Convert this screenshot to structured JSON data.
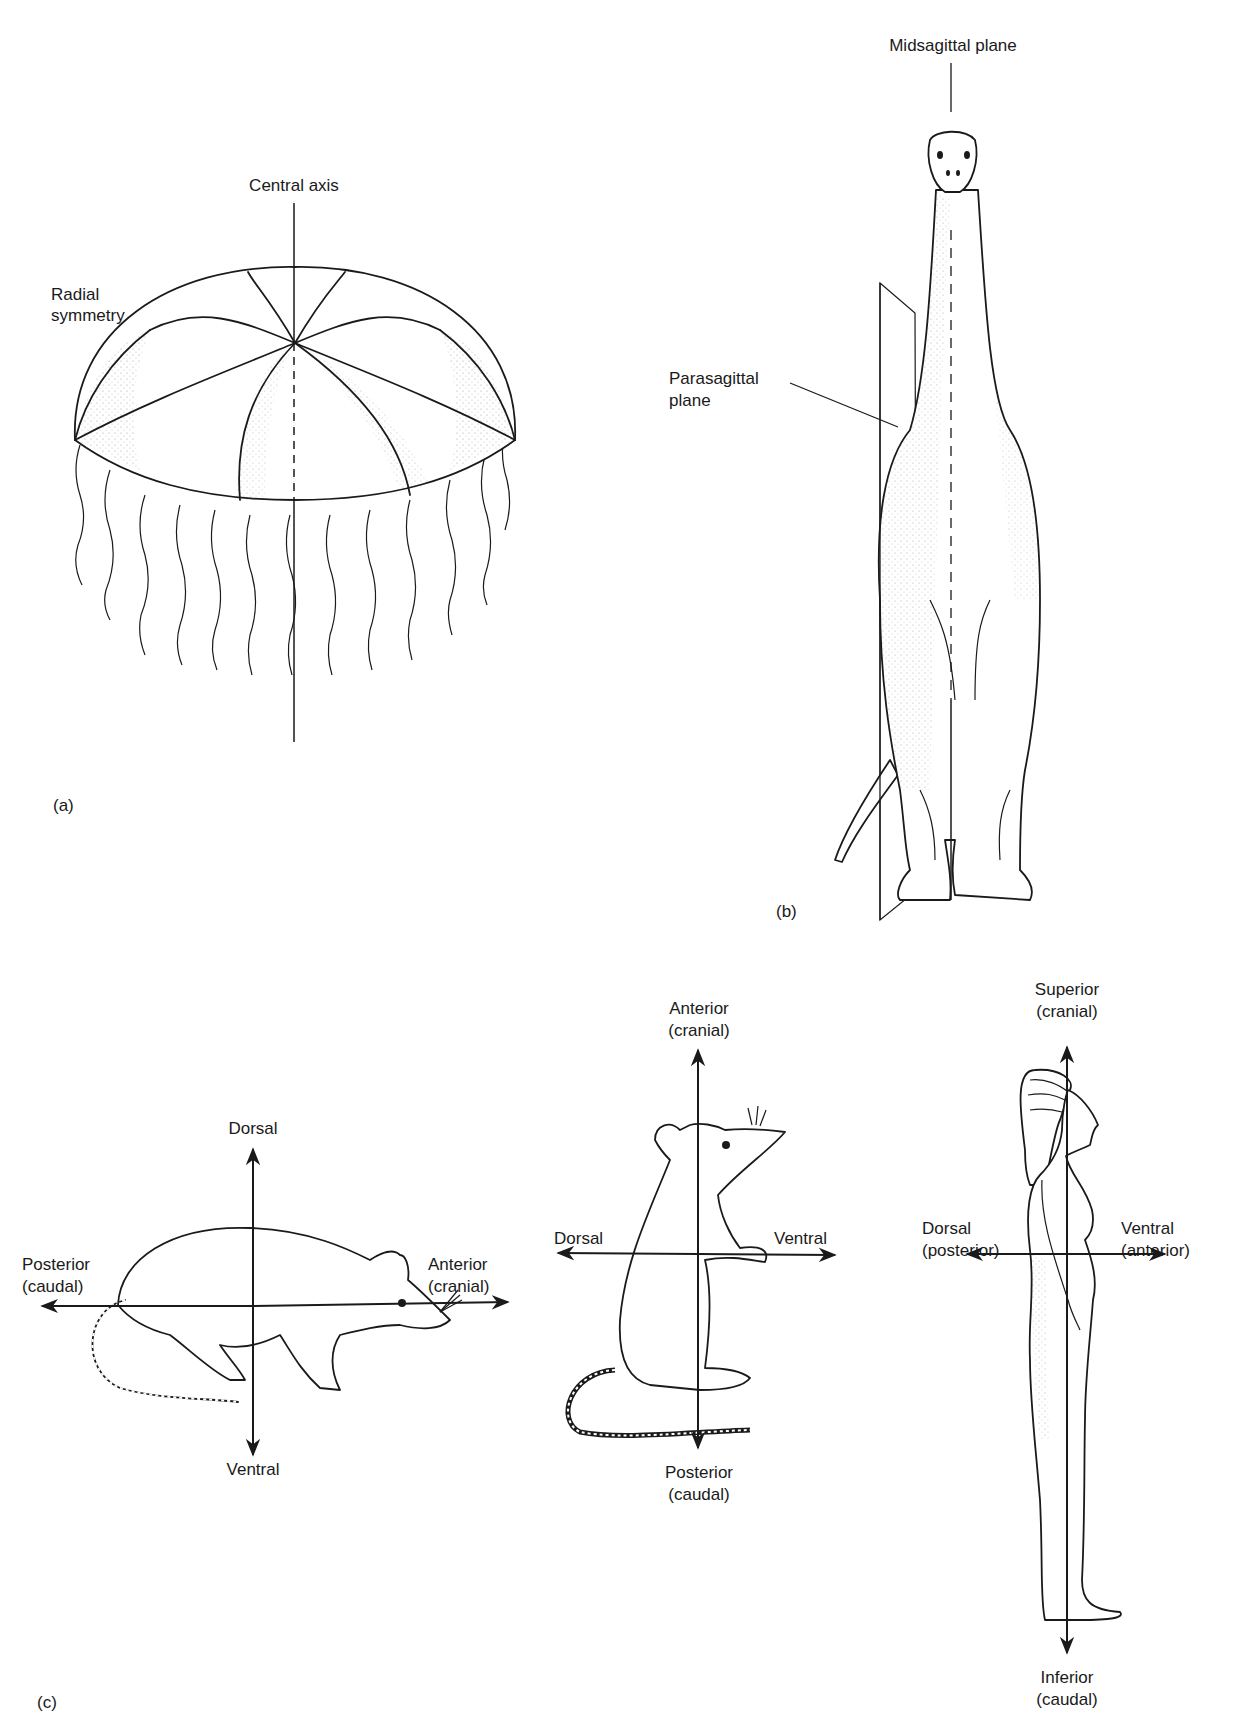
{
  "panel_a": {
    "tag": "(a)",
    "subject": "jellyfish",
    "labels": {
      "central_axis": "Central axis",
      "radial_symmetry_line1": "Radial",
      "radial_symmetry_line2": "symmetry"
    }
  },
  "panel_b": {
    "tag": "(b)",
    "subject": "sauropod dinosaur (front view)",
    "labels": {
      "midsagittal_plane": "Midsagittal plane",
      "parasagittal_line1": "Parasagittal",
      "parasagittal_line2": "plane"
    }
  },
  "panel_c": {
    "tag": "(c)",
    "rat_quadruped": {
      "up": "Dorsal",
      "down": "Ventral",
      "left_line1": "Posterior",
      "left_line2": "(caudal)",
      "right_line1": "Anterior",
      "right_line2": "(cranial)"
    },
    "rat_upright": {
      "up_line1": "Anterior",
      "up_line2": "(cranial)",
      "down_line1": "Posterior",
      "down_line2": "(caudal)",
      "left": "Dorsal",
      "right": "Ventral"
    },
    "human": {
      "up_line1": "Superior",
      "up_line2": "(cranial)",
      "down_line1": "Inferior",
      "down_line2": "(caudal)",
      "left_line1": "Dorsal",
      "left_line2": "(posterior)",
      "right_line1": "Ventral",
      "right_line2": "(anterior)"
    }
  }
}
